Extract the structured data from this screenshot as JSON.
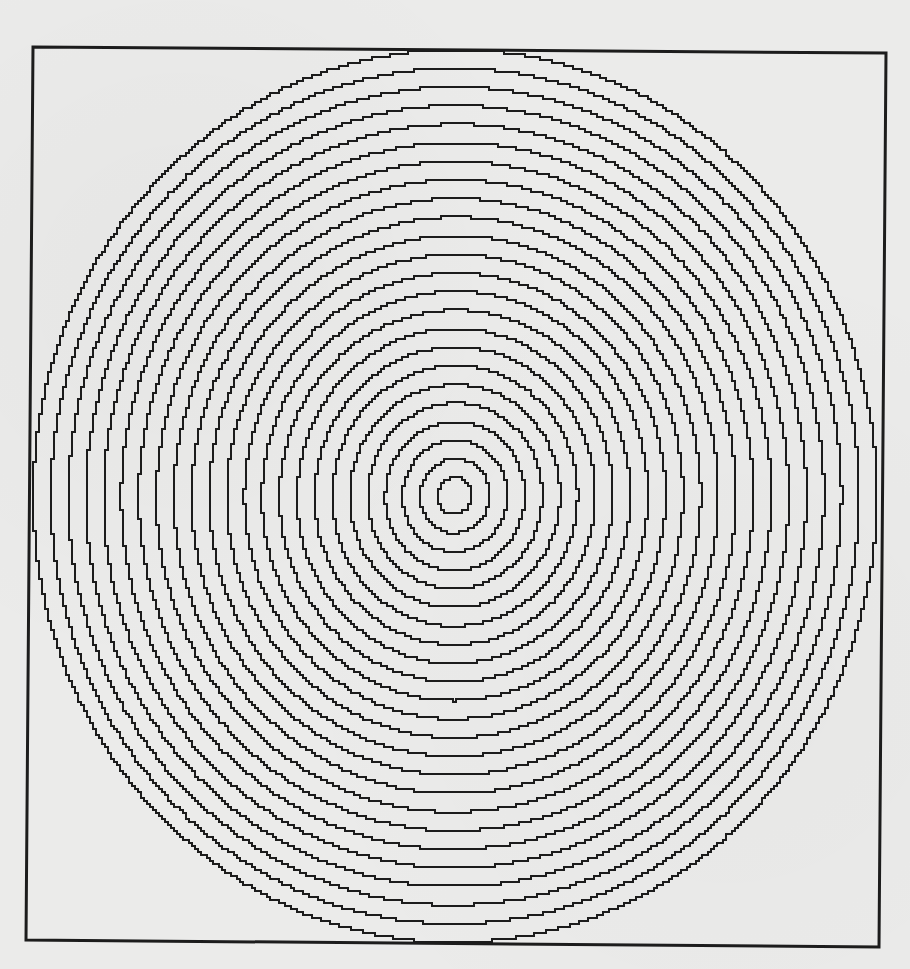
{
  "page": {
    "width": 910,
    "height": 969,
    "paper_color": "#ebebea",
    "ink_color": "#1c1c1c"
  },
  "figure": {
    "title": "",
    "type": "concentric-rings-printout",
    "frame": {
      "corners": {
        "top_left": [
          33,
          47
        ],
        "top_right": [
          886,
          53
        ],
        "bottom_right": [
          879,
          947
        ],
        "bottom_left": [
          26,
          940
        ]
      },
      "stroke_width": 3
    },
    "rings": {
      "count": 24,
      "center": [
        455,
        496
      ],
      "inner_radius_x": 17,
      "inner_radius_y": 18.5,
      "step_x": 17.6,
      "step_y": 18.6,
      "stroke_width": 2.6,
      "pixel_step": 3
    }
  }
}
